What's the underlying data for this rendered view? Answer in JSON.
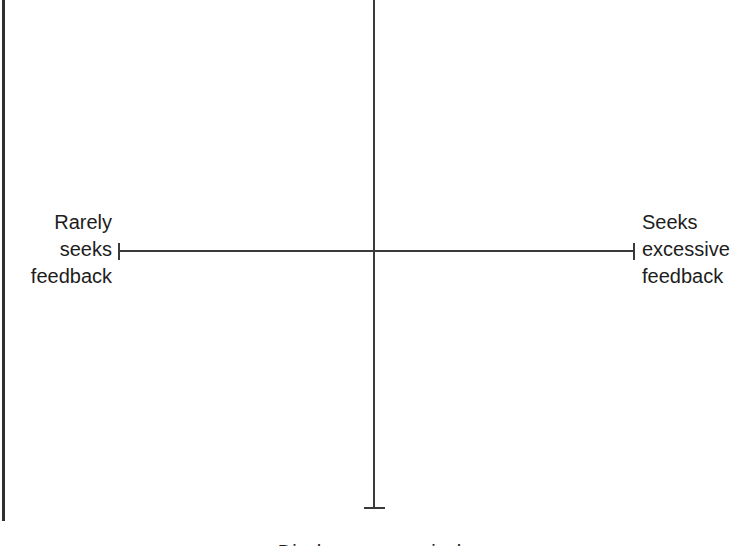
{
  "diagram": {
    "type": "two-axis-cross-scale",
    "background_color": "#ffffff",
    "line_color": "#3a3a3a",
    "text_color": "#1d1d1d",
    "axes": {
      "horizontal": {
        "left_label": "Rarely\nseeks\nfeedback",
        "right_label": "Seeks\nexcessive\nfeedback",
        "left_tick": true,
        "right_tick": true
      },
      "vertical": {
        "top_label": "",
        "bottom_label": "Discloses excessively",
        "top_tick": false,
        "bottom_tick": true
      }
    }
  }
}
